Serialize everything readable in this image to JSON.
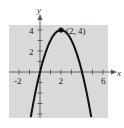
{
  "chart_data": {
    "type": "line",
    "title": "",
    "xlabel": "x",
    "ylabel": "y",
    "xlim": [
      -2.9,
      6.5
    ],
    "ylim": [
      -4.3,
      4.6
    ],
    "grid": false,
    "background": "#d9d9d9",
    "curve_color": "#111111",
    "xticks": [
      -2,
      -1,
      1,
      2,
      3,
      4,
      5,
      6
    ],
    "xtick_labels": [
      "-2",
      "2",
      "6"
    ],
    "yticks": [
      -4,
      -3,
      -2,
      -1,
      1,
      2,
      3,
      4
    ],
    "ytick_labels": [
      "2",
      "4"
    ],
    "series": [
      {
        "name": "y = -(x - 2)^2 + 4",
        "x": [
          -0.88,
          -0.5,
          0,
          0.5,
          1,
          1.5,
          2,
          2.5,
          3,
          3.5,
          4,
          4.5,
          4.88
        ],
        "y": [
          -4.3,
          -2.25,
          0,
          1.75,
          3,
          3.75,
          4,
          3.75,
          3,
          1.75,
          0,
          -2.25,
          -4.3
        ]
      }
    ],
    "annotations": [
      {
        "text": "(2, 4)",
        "x": 2,
        "y": 4,
        "marker": "dot"
      }
    ]
  },
  "labels": {
    "x_axis": "x",
    "y_axis": "y",
    "xtick_neg2": "-2",
    "xtick_2": "2",
    "xtick_6": "6",
    "ytick_2": "2",
    "ytick_4": "4",
    "vertex": "(2, 4)"
  }
}
